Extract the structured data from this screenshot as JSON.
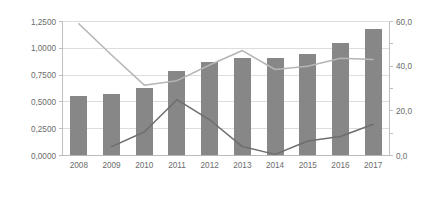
{
  "chart_data": {
    "type": "bar",
    "title": "",
    "subtitle": "",
    "xlabel": "",
    "ylabel": "",
    "y2label": "",
    "grid": true,
    "legend": "none",
    "categories": [
      "2008",
      "2009",
      "2010",
      "2011",
      "2012",
      "2013",
      "2014",
      "2015",
      "2016",
      "2017"
    ],
    "ylim": [
      0,
      1.25
    ],
    "y2lim": [
      0,
      60
    ],
    "left_axis": {
      "tick_values": [
        0,
        0.25,
        0.5,
        0.75,
        1.0,
        1.25
      ],
      "tick_labels": [
        "0,0000",
        "0,2500",
        "0,5000",
        "0,7500",
        "1,0000",
        "1,2500"
      ]
    },
    "right_axis": {
      "tick_values": [
        0,
        10,
        20,
        30,
        40,
        50,
        60
      ],
      "tick_labels": [
        "0,0",
        "",
        "20,0",
        "",
        "40,0",
        "",
        "60,0"
      ],
      "labeled_values": [
        0,
        20,
        40,
        60
      ],
      "labeled_texts": [
        "0,0",
        "20,0",
        "40,0",
        "60,0"
      ]
    },
    "series": [
      {
        "name": "bars",
        "type": "bar",
        "axis": "left",
        "color": "#878787",
        "values": [
          0.553,
          0.57,
          0.632,
          0.788,
          0.87,
          0.913,
          0.908,
          0.948,
          1.048,
          1.178
        ]
      },
      {
        "name": "light-line",
        "type": "line",
        "axis": "right",
        "color": "#b5b5b5",
        "values": [
          59.0,
          45.0,
          31.5,
          33.5,
          40.5,
          47.0,
          38.5,
          40.0,
          43.5,
          43.0
        ]
      },
      {
        "name": "dark-line",
        "type": "line",
        "axis": "right",
        "color": "#6e6e6e",
        "values": [
          null,
          4.0,
          10.5,
          25.0,
          16.0,
          4.0,
          0.5,
          6.5,
          8.5,
          14.0
        ]
      }
    ]
  },
  "colors": {
    "bar": "#878787",
    "light_line": "#b5b5b5",
    "dark_line": "#6e6e6e",
    "gridline": "#d4d4d4",
    "axis": "#b8b8b8",
    "tick_text": "#6b6b6b",
    "background": "#ffffff"
  }
}
